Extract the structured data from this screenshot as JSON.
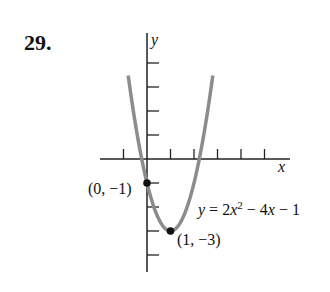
{
  "problem": {
    "number": "29."
  },
  "chart_data": {
    "type": "line",
    "title": "",
    "xlabel": "x",
    "ylabel": "y",
    "equation": "y = 2x^2 - 4x - 1",
    "equation_label": {
      "y": "y",
      "eq": " = 2",
      "x1": "x",
      "sup": "2",
      "rest": " − 4",
      "x2": "x",
      "tail": " − 1"
    },
    "x_ticks": [
      -1,
      1,
      2,
      3,
      4,
      5
    ],
    "y_ticks": [
      -4,
      -3,
      -2,
      -1,
      1,
      2,
      3,
      4
    ],
    "xlim": [
      -2,
      6
    ],
    "ylim": [
      -4.5,
      5.3
    ],
    "points": [
      {
        "x": 0,
        "y": -1,
        "label": "(0, −1)"
      },
      {
        "x": 1,
        "y": -3,
        "label": "(1, −3)"
      }
    ],
    "curve_color": "#8c8c8c",
    "axis_color": "#222222"
  }
}
